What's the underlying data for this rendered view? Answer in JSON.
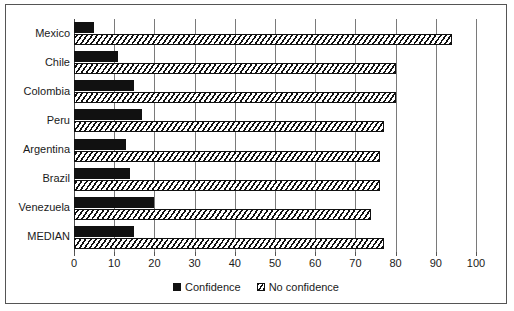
{
  "chart_data": {
    "type": "bar",
    "orientation": "horizontal",
    "title": "",
    "subtitle": "",
    "xlabel": "",
    "ylabel": "",
    "xlim": [
      0,
      100
    ],
    "xticks": [
      0,
      10,
      20,
      30,
      40,
      50,
      60,
      70,
      80,
      90,
      100
    ],
    "xtick_labels": [
      "0",
      "10",
      "20",
      "30",
      "40",
      "50",
      "60",
      "70",
      "80",
      "90",
      "100"
    ],
    "grid": true,
    "grid_axis": "x",
    "legend_position": "bottom-center",
    "categories": [
      "Mexico",
      "Chile",
      "Colombia",
      "Peru",
      "Argentina",
      "Brazil",
      "Venezuela",
      "MEDIAN"
    ],
    "series": [
      {
        "name": "Confidence",
        "pattern": "solid",
        "color": "#111111",
        "values": [
          5,
          11,
          15,
          17,
          13,
          14,
          20,
          15
        ]
      },
      {
        "name": "No confidence",
        "pattern": "hatched-diagonal",
        "color": "#111111",
        "values": [
          94,
          80,
          80,
          77,
          76,
          76,
          74,
          77
        ]
      }
    ]
  },
  "legend": {
    "entries": [
      {
        "label": "Confidence",
        "swatch": "solid-square"
      },
      {
        "label": "No confidence",
        "swatch": "hatched-square"
      }
    ]
  },
  "colors": {
    "frame": "#555555",
    "gridline": "#7a7a7a",
    "bar_outline": "#111111",
    "background": "#ffffff",
    "text": "#1a1a1a"
  }
}
